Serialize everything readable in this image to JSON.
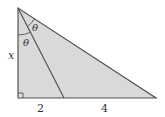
{
  "diagram": {
    "type": "right-triangle",
    "fill_color": "#d9d9d9",
    "stroke_color": "#555555",
    "vertices": {
      "apex": [
        18,
        8
      ],
      "right_angle": [
        18,
        98
      ],
      "right": [
        156,
        98
      ],
      "inner_foot": [
        64,
        98
      ]
    },
    "labels": {
      "side_vertical": "x",
      "base_left_segment": "2",
      "base_right_segment": "4",
      "angle_upper": "θ",
      "angle_lower": "θ"
    },
    "right_angle_marker": true
  }
}
